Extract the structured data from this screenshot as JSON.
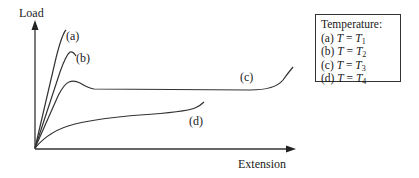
{
  "diagram": {
    "type": "load-extension curves",
    "y_axis_label": "Load",
    "x_axis_label": "Extension",
    "curves": [
      {
        "id": "a",
        "label": "(a)",
        "description": "steep rise, ends abruptly at high load"
      },
      {
        "id": "b",
        "label": "(b)",
        "description": "steep rise to peak then small drop"
      },
      {
        "id": "c",
        "label": "(c)",
        "description": "rise to peak, drop, long plateau, then rise"
      },
      {
        "id": "d",
        "label": "(d)",
        "description": "gradual rising curve at low load"
      }
    ],
    "legend": {
      "title": "Temperature:",
      "items": [
        {
          "key": "(a)",
          "var": "T",
          "eq": "=",
          "val": "T",
          "sub": "1"
        },
        {
          "key": "(b)",
          "var": "T",
          "eq": "=",
          "val": "T",
          "sub": "2"
        },
        {
          "key": "(c)",
          "var": "T",
          "eq": "=",
          "val": "T",
          "sub": "3"
        },
        {
          "key": "(d)",
          "var": "T",
          "eq": "=",
          "val": "T",
          "sub": "4"
        }
      ]
    },
    "colors": {
      "line": "#333333",
      "background": "#ffffff"
    }
  }
}
